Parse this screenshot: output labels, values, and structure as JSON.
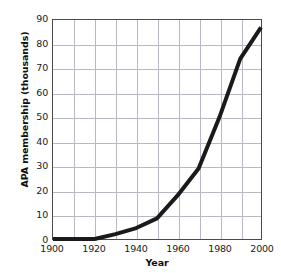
{
  "chart_data": {
    "type": "line",
    "title": "",
    "xlabel": "Year",
    "ylabel": "APA membership (thousands)",
    "xlim": [
      1900,
      2000
    ],
    "ylim": [
      0,
      90
    ],
    "xticks": [
      1900,
      1920,
      1940,
      1960,
      1980,
      2000
    ],
    "yticks": [
      0,
      10,
      20,
      30,
      40,
      50,
      60,
      70,
      80,
      90
    ],
    "xtick_labels": [
      "1900",
      "1920",
      "1940",
      "1960",
      "1980",
      "2000"
    ],
    "ytick_labels": [
      "0",
      "10",
      "20",
      "30",
      "40",
      "50",
      "60",
      "70",
      "80",
      "90"
    ],
    "grid": true,
    "grid_x_step": 10,
    "grid_y_step": 10,
    "legend": "none",
    "line_color": "#1a1a1a",
    "line_width": 4,
    "x": [
      1900,
      1910,
      1920,
      1930,
      1940,
      1950,
      1960,
      1970,
      1980,
      1990,
      2000
    ],
    "values": [
      0,
      0,
      0,
      2,
      4.5,
      8.5,
      18,
      29,
      50,
      74,
      87
    ],
    "series": [
      {
        "name": "APA membership",
        "values": [
          0,
          0,
          0,
          2,
          4.5,
          8.5,
          18,
          29,
          50,
          74,
          87
        ]
      }
    ]
  }
}
